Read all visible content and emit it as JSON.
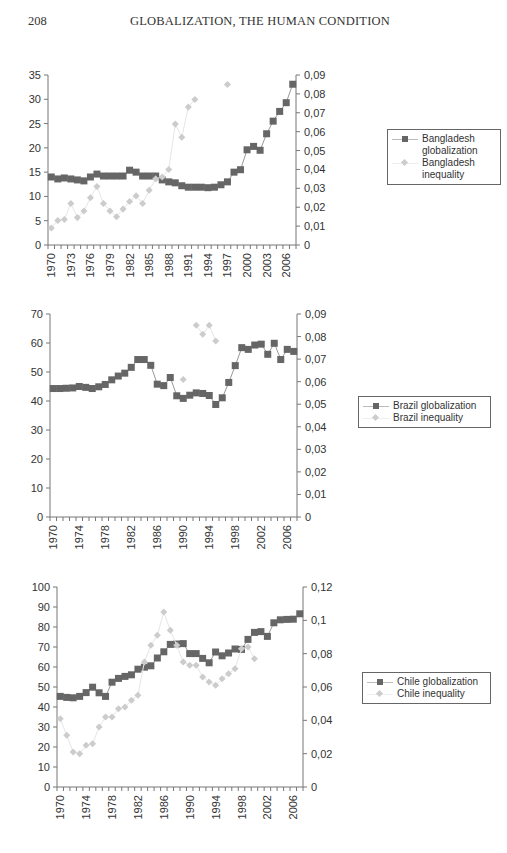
{
  "page": {
    "page_number": "208",
    "running_title": "GLOBALIZATION, THE HUMAN CONDITION"
  },
  "colors": {
    "globalization_marker": "#666666",
    "globalization_line": "#999999",
    "inequality_marker": "#cccccc",
    "inequality_line": "#e6e6e6",
    "axis": "#777777"
  },
  "chart_data": [
    {
      "type": "line",
      "title": "Bangladesh",
      "xlabel": "",
      "ylabel_left": "",
      "ylabel_right": "",
      "x": [
        1970,
        1971,
        1972,
        1973,
        1974,
        1975,
        1976,
        1977,
        1978,
        1979,
        1980,
        1981,
        1982,
        1983,
        1984,
        1985,
        1986,
        1987,
        1988,
        1989,
        1990,
        1991,
        1992,
        1993,
        1994,
        1995,
        1996,
        1997,
        1998,
        1999,
        2000,
        2001,
        2002,
        2003,
        2004,
        2005,
        2006,
        2007
      ],
      "x_tick_labels": [
        "1970",
        "1973",
        "1976",
        "1979",
        "1982",
        "1985",
        "1988",
        "1991",
        "1994",
        "1997",
        "2000",
        "2003",
        "2006"
      ],
      "y_left_ticks": [
        "0",
        "5",
        "10",
        "15",
        "20",
        "25",
        "30",
        "35"
      ],
      "y_right_ticks": [
        "0",
        "0,01",
        "0,02",
        "0,03",
        "0,04",
        "0,05",
        "0,06",
        "0,07",
        "0,08",
        "0,09"
      ],
      "ylim_left": [
        0,
        35
      ],
      "ylim_right": [
        0,
        0.09
      ],
      "grid": false,
      "legend_position": "right",
      "series": [
        {
          "name": "Bangladesh globalization",
          "axis": "left",
          "marker": "square",
          "values": [
            14.0,
            13.6,
            13.8,
            13.6,
            13.4,
            13.2,
            14.0,
            14.6,
            14.2,
            14.2,
            14.2,
            14.2,
            15.4,
            15.0,
            14.2,
            14.2,
            14.2,
            13.4,
            13.0,
            12.8,
            12.2,
            11.9,
            11.9,
            11.9,
            11.8,
            11.9,
            12.4,
            13.0,
            15.0,
            15.5,
            19.6,
            20.3,
            19.5,
            22.9,
            25.5,
            27.5,
            29.3,
            33.1
          ]
        },
        {
          "name": "Bangladesh inequality",
          "axis": "right",
          "marker": "diamond",
          "values": [
            0.009,
            0.013,
            0.0135,
            0.022,
            0.0145,
            0.018,
            0.025,
            0.031,
            0.022,
            0.018,
            0.015,
            0.019,
            0.023,
            0.026,
            0.022,
            0.029,
            0.035,
            0.036,
            0.04,
            0.064,
            0.057,
            0.073,
            0.077,
            null,
            null,
            null,
            null,
            0.085,
            null,
            null,
            null,
            null,
            null,
            null,
            null,
            null,
            null,
            null
          ]
        }
      ]
    },
    {
      "type": "line",
      "title": "Brazil",
      "xlabel": "",
      "x": [
        1970,
        1971,
        1972,
        1973,
        1974,
        1975,
        1976,
        1977,
        1978,
        1979,
        1980,
        1981,
        1982,
        1983,
        1984,
        1985,
        1986,
        1987,
        1988,
        1989,
        1990,
        1991,
        1992,
        1993,
        1994,
        1995,
        1996,
        1997,
        1998,
        1999,
        2000,
        2001,
        2002,
        2003,
        2004,
        2005,
        2006,
        2007
      ],
      "x_tick_labels": [
        "1970",
        "1974",
        "1978",
        "1982",
        "1986",
        "1990",
        "1994",
        "1998",
        "2002",
        "2006"
      ],
      "y_left_ticks": [
        "0",
        "10",
        "20",
        "30",
        "40",
        "50",
        "60",
        "70"
      ],
      "y_right_ticks": [
        "0",
        "0,01",
        "0,02",
        "0,03",
        "0,04",
        "0,05",
        "0,06",
        "0,07",
        "0,08",
        "0,09"
      ],
      "ylim_left": [
        0,
        70
      ],
      "ylim_right": [
        0,
        0.09
      ],
      "grid": false,
      "legend_position": "right",
      "series": [
        {
          "name": "Brazil globalization",
          "axis": "left",
          "marker": "square",
          "values": [
            44.3,
            44.3,
            44.4,
            44.5,
            45.0,
            44.7,
            44.3,
            44.9,
            45.7,
            47.3,
            48.6,
            49.6,
            51.6,
            54.3,
            54.3,
            52.3,
            45.8,
            45.3,
            48.1,
            41.8,
            40.9,
            42.0,
            42.8,
            42.6,
            41.9,
            38.8,
            41.1,
            46.4,
            52.2,
            58.4,
            57.8,
            59.3,
            59.6,
            56.1,
            59.9,
            54.3,
            57.8,
            57.1
          ]
        },
        {
          "name": "Brazil inequality",
          "axis": "right",
          "marker": "diamond",
          "values": [
            null,
            null,
            null,
            null,
            null,
            null,
            null,
            null,
            null,
            null,
            null,
            null,
            null,
            null,
            null,
            null,
            null,
            null,
            null,
            null,
            0.061,
            null,
            0.085,
            0.081,
            0.085,
            0.078,
            null,
            null,
            null,
            null,
            null,
            null,
            null,
            null,
            null,
            null,
            null,
            null
          ]
        }
      ]
    },
    {
      "type": "line",
      "title": "Chile",
      "xlabel": "",
      "x": [
        1970,
        1971,
        1972,
        1973,
        1974,
        1975,
        1976,
        1977,
        1978,
        1979,
        1980,
        1981,
        1982,
        1983,
        1984,
        1985,
        1986,
        1987,
        1988,
        1989,
        1990,
        1991,
        1992,
        1993,
        1994,
        1995,
        1996,
        1997,
        1998,
        1999,
        2000,
        2001,
        2002,
        2003,
        2004,
        2005,
        2006,
        2007
      ],
      "x_tick_labels": [
        "1970",
        "1974",
        "1978",
        "1982",
        "1986",
        "1990",
        "1994",
        "1998",
        "2002",
        "2006"
      ],
      "y_left_ticks": [
        "0",
        "10",
        "20",
        "30",
        "40",
        "50",
        "60",
        "70",
        "80",
        "90",
        "100"
      ],
      "y_right_ticks": [
        "0",
        "0,02",
        "0,04",
        "0,06",
        "0,08",
        "0,1",
        "0,12"
      ],
      "ylim_left": [
        0,
        100
      ],
      "ylim_right": [
        0,
        0.12
      ],
      "grid": false,
      "legend_position": "right",
      "series": [
        {
          "name": "Chile globalization",
          "axis": "left",
          "marker": "square",
          "values": [
            45.3,
            44.8,
            44.6,
            45.3,
            47.2,
            49.9,
            47.1,
            45.3,
            52.4,
            54.3,
            55.3,
            56.1,
            58.9,
            59.9,
            60.6,
            64.5,
            67.6,
            71.3,
            71.5,
            71.7,
            66.7,
            66.7,
            64.3,
            62.1,
            67.5,
            65.6,
            67.0,
            69.0,
            68.8,
            73.8,
            77.3,
            77.7,
            75.3,
            82.1,
            83.6,
            83.8,
            83.9,
            86.6
          ]
        },
        {
          "name": "Chile inequality",
          "axis": "right",
          "marker": "diamond",
          "values": [
            0.041,
            0.031,
            0.021,
            0.02,
            0.025,
            0.026,
            0.036,
            0.042,
            0.042,
            0.047,
            0.048,
            0.052,
            0.055,
            0.075,
            0.085,
            0.091,
            0.105,
            0.094,
            0.085,
            0.075,
            0.073,
            0.073,
            0.066,
            0.063,
            0.061,
            0.065,
            0.068,
            0.071,
            0.083,
            0.084,
            0.077,
            null,
            null,
            null,
            null,
            null,
            null,
            null
          ]
        }
      ]
    }
  ],
  "legends": [
    {
      "items": [
        {
          "label_line1": "Bangladesh",
          "label_line2": "globalization"
        },
        {
          "label_line1": "Bangladesh",
          "label_line2": "inequality"
        }
      ]
    },
    {
      "items": [
        {
          "label": "Brazil globalization"
        },
        {
          "label": "Brazil inequality"
        }
      ]
    },
    {
      "items": [
        {
          "label": "Chile globalization"
        },
        {
          "label": "Chile inequality"
        }
      ]
    }
  ]
}
